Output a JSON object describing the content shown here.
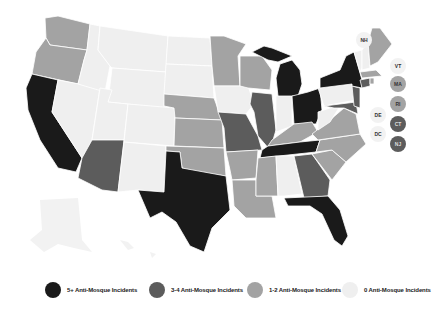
{
  "colors": {
    "five_plus": "#1a1a1a",
    "three_four": "#5c5c5c",
    "one_two": "#a3a3a3",
    "zero": "#efefef"
  },
  "legend": [
    {
      "label": "5+ Anti-Mosque Incidents",
      "category": "five_plus"
    },
    {
      "label": "3-4 Anti-Mosque Incidents",
      "category": "three_four"
    },
    {
      "label": "1-2 Anti-Mosque Incidents",
      "category": "one_two"
    },
    {
      "label": "0 Anti-Mosque Incidents",
      "category": "zero"
    }
  ],
  "small_states": [
    {
      "abbr": "NH",
      "category": "zero"
    },
    {
      "abbr": "VT",
      "category": "zero"
    },
    {
      "abbr": "MA",
      "category": "one_two"
    },
    {
      "abbr": "RI",
      "category": "one_two"
    },
    {
      "abbr": "DE",
      "category": "zero"
    },
    {
      "abbr": "CT",
      "category": "three_four"
    },
    {
      "abbr": "DC",
      "category": "zero"
    },
    {
      "abbr": "NJ",
      "category": "three_four"
    }
  ],
  "states": {
    "five_plus": [
      "CA",
      "TX",
      "MI",
      "OH",
      "NY",
      "TN",
      "FL"
    ],
    "three_four": [
      "AZ",
      "IL",
      "MO",
      "GA",
      "NJ",
      "CT",
      "MD"
    ],
    "one_two": [
      "WA",
      "OR",
      "MN",
      "WI",
      "NE",
      "KS",
      "OK",
      "AR",
      "LA",
      "MS",
      "KY",
      "VA",
      "NC",
      "SC",
      "ME",
      "MA",
      "RI",
      "PA-edge"
    ],
    "zero": [
      "ID",
      "MT",
      "WY",
      "NV",
      "UT",
      "CO",
      "NM",
      "ND",
      "SD",
      "IA",
      "IN",
      "AL",
      "WV",
      "PA",
      "NH",
      "VT",
      "DE",
      "DC",
      "AK",
      "HI"
    ]
  }
}
